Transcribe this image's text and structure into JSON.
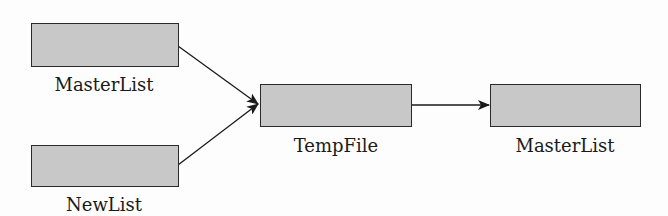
{
  "diagram": {
    "nodes": [
      {
        "id": "masterlist-in",
        "label": "MasterList"
      },
      {
        "id": "newlist",
        "label": "NewList"
      },
      {
        "id": "tempfile",
        "label": "TempFile"
      },
      {
        "id": "masterlist-out",
        "label": "MasterList"
      }
    ],
    "edges": [
      {
        "from": "masterlist-in",
        "to": "tempfile"
      },
      {
        "from": "newlist",
        "to": "tempfile"
      },
      {
        "from": "tempfile",
        "to": "masterlist-out"
      }
    ],
    "colors": {
      "box_fill": "#c8c8c8",
      "box_border": "#2a2a2a",
      "arrow": "#1a1a1a"
    }
  }
}
